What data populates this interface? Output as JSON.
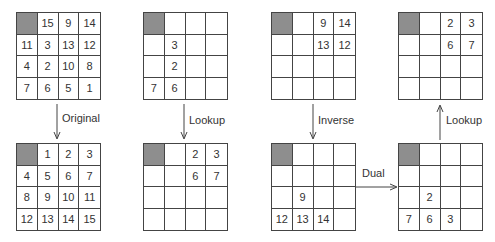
{
  "colors": {
    "blank_tile": "#8e8e8e",
    "line": "#444444",
    "text": "#333333"
  },
  "grids": {
    "g1_top": {
      "cells": [
        "",
        "15",
        "9",
        "14",
        "11",
        "3",
        "13",
        "12",
        "4",
        "2",
        "10",
        "8",
        "7",
        "6",
        "5",
        "1"
      ]
    },
    "g1_bottom": {
      "cells": [
        "",
        "1",
        "2",
        "3",
        "4",
        "5",
        "6",
        "7",
        "8",
        "9",
        "10",
        "11",
        "12",
        "13",
        "14",
        "15"
      ]
    },
    "g2_top": {
      "cells": [
        "",
        "",
        "",
        "",
        "",
        "3",
        "",
        "",
        "",
        "2",
        "",
        "",
        "7",
        "6",
        "",
        ""
      ]
    },
    "g2_bottom": {
      "cells": [
        "",
        "",
        "2",
        "3",
        "",
        "",
        "6",
        "7",
        "",
        "",
        "",
        "",
        "",
        "",
        "",
        ""
      ]
    },
    "g3_top": {
      "cells": [
        "",
        "",
        "9",
        "14",
        "",
        "",
        "13",
        "12",
        "",
        "",
        "",
        "",
        "",
        "",
        "",
        ""
      ]
    },
    "g3_bottom": {
      "cells": [
        "",
        "",
        "",
        "",
        "",
        "",
        "",
        "",
        "",
        "9",
        "",
        "",
        "12",
        "13",
        "14",
        ""
      ]
    },
    "g4_top": {
      "cells": [
        "",
        "",
        "2",
        "3",
        "",
        "",
        "6",
        "7",
        "",
        "",
        "",
        "",
        "",
        "",
        "",
        ""
      ]
    },
    "g4_bottom": {
      "cells": [
        "",
        "",
        "",
        "",
        "",
        "",
        "",
        "",
        "",
        "2",
        "",
        "",
        "7",
        "6",
        "3",
        ""
      ]
    }
  },
  "arrows": {
    "a1": {
      "label": "Original",
      "direction": "down"
    },
    "a2": {
      "label": "Lookup",
      "direction": "down"
    },
    "a3": {
      "label": "Inverse",
      "direction": "down"
    },
    "a4": {
      "label": "Dual",
      "direction": "right"
    },
    "a5": {
      "label": "Lookup",
      "direction": "up"
    }
  }
}
